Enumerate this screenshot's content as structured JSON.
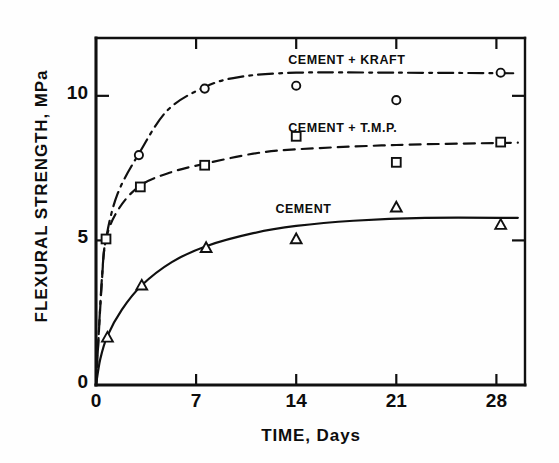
{
  "figure": {
    "background": "#fefefe",
    "ink_color": "#101010"
  },
  "chart_data": {
    "type": "line",
    "title": "",
    "xlabel": "TIME, Days",
    "ylabel": "FLEXURAL STRENGTH, MPa",
    "xlim": [
      0,
      30
    ],
    "ylim": [
      0,
      12
    ],
    "xticks": [
      0,
      7,
      14,
      21,
      28
    ],
    "xtick_labels": [
      "0",
      "7",
      "14",
      "21",
      "28"
    ],
    "yticks": [
      0,
      5,
      10
    ],
    "ytick_labels": [
      "0",
      "5",
      "10"
    ],
    "grid": false,
    "legend": "inline-annotations",
    "series": [
      {
        "name": "CEMENT + KRAFT",
        "marker": "circle",
        "linestyle": "dashdot",
        "label_x": 17.5,
        "label_y": 11.2,
        "points": [
          {
            "x": 0.7,
            "y": 5.05
          },
          {
            "x": 3.0,
            "y": 7.95
          },
          {
            "x": 7.6,
            "y": 10.25
          },
          {
            "x": 14.0,
            "y": 10.35
          },
          {
            "x": 21.0,
            "y": 9.85
          },
          {
            "x": 28.3,
            "y": 10.8
          }
        ],
        "curve": [
          {
            "x": 0.0,
            "y": 0.0
          },
          {
            "x": 0.4,
            "y": 3.6
          },
          {
            "x": 0.7,
            "y": 5.05
          },
          {
            "x": 1.5,
            "y": 6.6
          },
          {
            "x": 3.0,
            "y": 8.0
          },
          {
            "x": 5.0,
            "y": 9.5
          },
          {
            "x": 7.6,
            "y": 10.3
          },
          {
            "x": 10.0,
            "y": 10.65
          },
          {
            "x": 14.0,
            "y": 10.8
          },
          {
            "x": 21.0,
            "y": 10.8
          },
          {
            "x": 29.5,
            "y": 10.78
          }
        ]
      },
      {
        "name": "CEMENT + T.M.P.",
        "marker": "square",
        "linestyle": "dashed",
        "label_x": 17.5,
        "label_y": 8.85,
        "points": [
          {
            "x": 0.7,
            "y": 5.05
          },
          {
            "x": 3.1,
            "y": 6.85
          },
          {
            "x": 7.6,
            "y": 7.6
          },
          {
            "x": 14.0,
            "y": 8.6
          },
          {
            "x": 21.0,
            "y": 7.7
          },
          {
            "x": 28.3,
            "y": 8.4
          }
        ],
        "curve": [
          {
            "x": 0.0,
            "y": 0.0
          },
          {
            "x": 0.4,
            "y": 3.5
          },
          {
            "x": 0.7,
            "y": 5.05
          },
          {
            "x": 1.6,
            "y": 6.1
          },
          {
            "x": 3.1,
            "y": 6.9
          },
          {
            "x": 5.2,
            "y": 7.35
          },
          {
            "x": 7.6,
            "y": 7.65
          },
          {
            "x": 11.0,
            "y": 8.0
          },
          {
            "x": 14.0,
            "y": 8.15
          },
          {
            "x": 21.0,
            "y": 8.3
          },
          {
            "x": 29.5,
            "y": 8.38
          }
        ]
      },
      {
        "name": "CEMENT",
        "marker": "triangle",
        "linestyle": "solid",
        "label_x": 16.6,
        "label_y": 6.05,
        "points": [
          {
            "x": 0.8,
            "y": 1.65
          },
          {
            "x": 3.2,
            "y": 3.45
          },
          {
            "x": 7.7,
            "y": 4.75
          },
          {
            "x": 14.0,
            "y": 5.05
          },
          {
            "x": 21.0,
            "y": 6.15
          },
          {
            "x": 28.3,
            "y": 5.55
          }
        ],
        "curve": [
          {
            "x": 0.0,
            "y": 0.0
          },
          {
            "x": 0.3,
            "y": 0.9
          },
          {
            "x": 0.8,
            "y": 1.7
          },
          {
            "x": 1.8,
            "y": 2.6
          },
          {
            "x": 3.2,
            "y": 3.45
          },
          {
            "x": 5.3,
            "y": 4.25
          },
          {
            "x": 7.7,
            "y": 4.8
          },
          {
            "x": 11.0,
            "y": 5.25
          },
          {
            "x": 14.0,
            "y": 5.5
          },
          {
            "x": 18.0,
            "y": 5.68
          },
          {
            "x": 23.0,
            "y": 5.78
          },
          {
            "x": 29.5,
            "y": 5.78
          }
        ]
      }
    ]
  }
}
